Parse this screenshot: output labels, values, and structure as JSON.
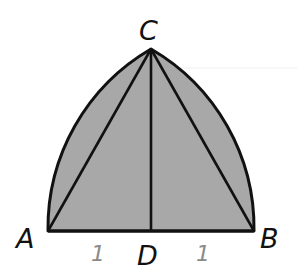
{
  "diagram": {
    "type": "geometric-figure",
    "fill_color": "#a8a8a8",
    "stroke_color": "#111111",
    "length_label_color": "#8a8a8a",
    "points": {
      "A": {
        "label": "A",
        "x": 48,
        "y": 231
      },
      "B": {
        "label": "B",
        "x": 254,
        "y": 231
      },
      "C": {
        "label": "C",
        "x": 151,
        "y": 49
      },
      "D": {
        "label": "D",
        "x": 151,
        "y": 231
      }
    },
    "segments": [
      "AC",
      "BC",
      "CD",
      "AB"
    ],
    "arcs": [
      {
        "from": "A",
        "to": "C",
        "center": "B"
      },
      {
        "from": "C",
        "to": "B",
        "center": "A"
      }
    ],
    "length_labels": [
      {
        "segment": "AD",
        "text": "1"
      },
      {
        "segment": "DB",
        "text": "1"
      }
    ]
  }
}
